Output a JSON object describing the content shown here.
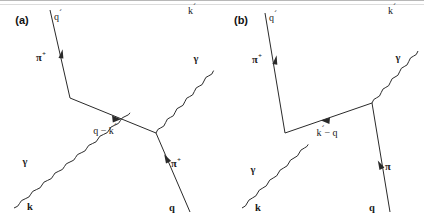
{
  "figure": {
    "kind": "feynman-diagram-pair",
    "background_color": "#ffffff",
    "line_color": "#2a2a2a",
    "text_color": "#1a1a1a"
  },
  "panels": [
    {
      "id": "a",
      "tag": "(a)",
      "labels": {
        "incoming_pion_momentum": "q",
        "incoming_pion_momentum_prime": "´",
        "incoming_pion": "π",
        "incoming_pion_charge": "+",
        "incoming_photon": "γ",
        "incoming_photon_momentum": "k",
        "outgoing_photon": "γ",
        "outgoing_photon_momentum": "k",
        "outgoing_photon_momentum_prime": "´",
        "outgoing_pion": "π",
        "outgoing_pion_charge": "+",
        "outgoing_pion_momentum": "q",
        "propagator": "q − k",
        "propagator_prime": "´"
      }
    },
    {
      "id": "b",
      "tag": "(b)",
      "labels": {
        "incoming_pion_momentum": "q",
        "incoming_pion_momentum_prime": "´",
        "incoming_pion": "π",
        "incoming_pion_charge": "+",
        "incoming_photon": "γ",
        "incoming_photon_momentum": "k",
        "outgoing_photon": "γ",
        "outgoing_photon_momentum": "k",
        "outgoing_photon_momentum_prime": "´",
        "outgoing_pion": "π",
        "outgoing_pion_charge": "+",
        "outgoing_pion_momentum": "q",
        "propagator": "k",
        "propagator_prime": "´",
        "propagator_rest": "− q"
      }
    }
  ]
}
